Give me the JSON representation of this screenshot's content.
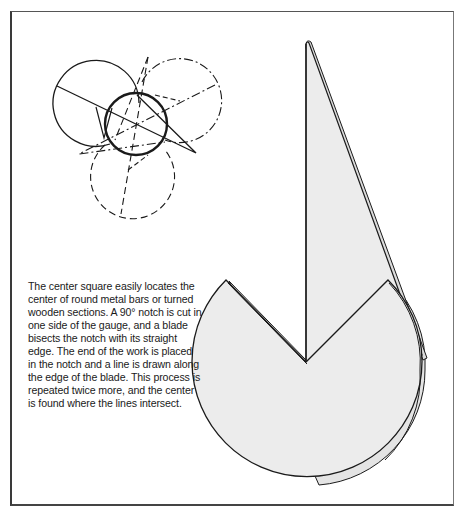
{
  "caption": {
    "text": "The center square easily locates the center of round metal bars or turned wooden sections. A 90° notch is cut in one side of the gauge, and a blade bisects the notch with its straight edge. The end of the work is placed in the notch and a line is drawn along the edge of the blade. This process is repeated twice more, and the center is found where the lines intersect."
  },
  "colors": {
    "ink": "#1a1a1a",
    "tool_fill": "#ececec",
    "background": "#ffffff"
  },
  "diagram": {
    "workpiece_circle": {
      "cx": 136,
      "cy": 124,
      "r": 31
    },
    "gauge_positions": [
      {
        "style": "solid",
        "cx": 96,
        "cy": 103,
        "r": 43
      },
      {
        "style": "dash-dot",
        "cx": 180,
        "cy": 100,
        "r": 42
      },
      {
        "style": "dashed",
        "cx": 130,
        "cy": 178,
        "r": 42
      }
    ],
    "intersection": {
      "x": 136,
      "y": 124
    }
  }
}
